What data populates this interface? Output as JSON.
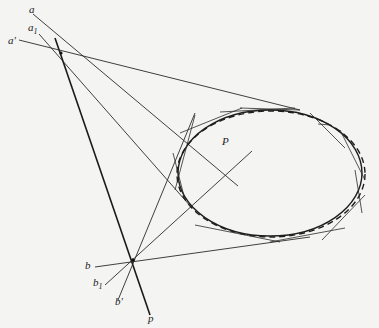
{
  "diagram": {
    "labels": {
      "a": "a",
      "a1": "a",
      "a1_sub": "1",
      "a_prime": "a'",
      "b": "b",
      "b1": "b",
      "b1_sub": "1",
      "b_prime": "b'",
      "p": "p",
      "P": "P"
    },
    "points": {
      "top_apex": [
        61,
        53
      ],
      "bottom_apex": [
        133,
        260
      ],
      "P": [
        225,
        160
      ]
    },
    "ellipse": {
      "cx": 270,
      "cy": 173,
      "rx": 93,
      "ry": 64,
      "style": "solid and dashed overlay"
    },
    "colors": {
      "background": "#f4f4f2",
      "ink": "#1e1e1e"
    }
  }
}
